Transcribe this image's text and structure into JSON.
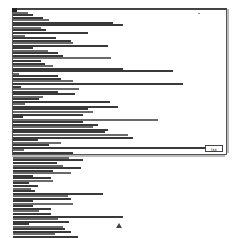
{
  "window": {
    "size_button_label": "Jxx"
  },
  "list": {
    "row_pitch": 2.55,
    "bar_lengths": [
      4,
      15,
      20,
      30,
      36,
      100,
      110,
      28,
      33,
      75,
      12,
      43,
      58,
      60,
      95,
      20,
      35,
      45,
      50,
      98,
      28,
      32,
      40,
      110,
      160,
      6,
      45,
      48,
      60,
      170,
      8,
      66,
      45,
      62,
      30,
      26,
      97,
      12,
      105,
      75,
      80,
      70,
      10,
      145,
      70,
      85,
      80,
      95,
      92,
      115,
      120,
      25,
      48,
      36,
      206,
      11,
      60,
      65,
      56,
      70,
      44,
      50,
      68,
      40,
      58,
      20,
      38,
      40,
      16,
      25,
      18,
      22,
      90,
      55,
      58,
      20,
      60,
      20,
      38,
      26,
      38,
      110,
      45,
      56,
      16,
      50,
      52,
      58,
      42,
      65,
      75,
      118,
      75,
      66
    ]
  },
  "colors": {
    "bar": "#3a3a3a",
    "frame": "#555555",
    "background": "#ffffff"
  }
}
